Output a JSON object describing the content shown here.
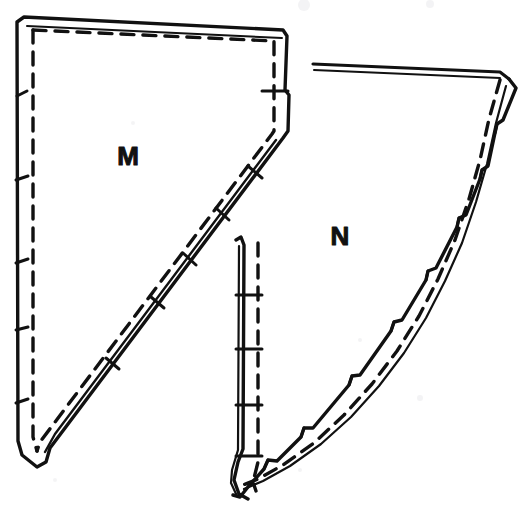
{
  "figure": {
    "kind": "sewing-pattern-diagram",
    "background_color": "#ffffff",
    "ink_color": "#111111",
    "width": 526,
    "height": 526
  },
  "pieces": [
    {
      "id": "piece-m",
      "label": "M",
      "label_x": 128,
      "label_y": 165,
      "shape": "quadrilateral with straight top edge, straight left edge, short vertical right edge and long diagonal edge meeting at a pointed bottom",
      "notch_count_left": 5,
      "notch_count_diagonal": 5,
      "notch_count_right": 1
    },
    {
      "id": "piece-n",
      "label": "N",
      "label_x": 340,
      "label_y": 245,
      "shape": "piece with straight top edge, long concave curved right edge, curved bottom edge and straight vertical left edge",
      "notch_count_right": 5,
      "notch_count_left": 4
    }
  ],
  "line_styles": {
    "cutting_line": "solid",
    "seam_line": "dashed",
    "dash_pattern": "12 8"
  }
}
